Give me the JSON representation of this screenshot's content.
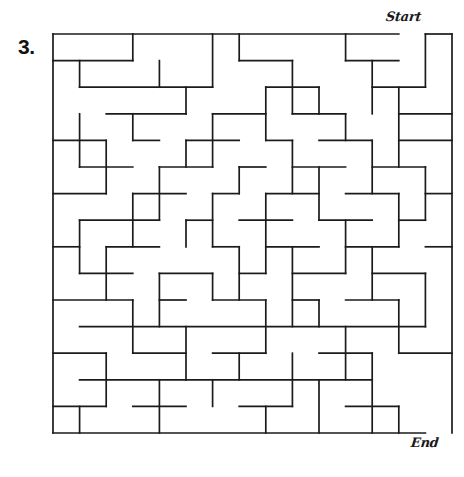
{
  "page": {
    "background_color": "#ffffff",
    "width": 464,
    "height": 477
  },
  "puzzle": {
    "number_label": "3.",
    "start_label": "Start",
    "end_label": "End",
    "type": "maze",
    "wall_color": "#1b1b1b",
    "grid": {
      "cols": 15,
      "rows": 15,
      "origin_x": 53,
      "origin_y": 34,
      "cell": 26.6
    },
    "entrance": {
      "side": "top",
      "col": 14,
      "description": "gap in top wall at rightmost column"
    },
    "exit": {
      "side": "bottom",
      "col": 14,
      "description": "gap in bottom wall at rightmost column"
    },
    "walls": {
      "h": [
        [
          0,
          0,
          13
        ],
        [
          14,
          0,
          15
        ],
        [
          0,
          1,
          3
        ],
        [
          7,
          1,
          9
        ],
        [
          11,
          1,
          13
        ],
        [
          1,
          2,
          6
        ],
        [
          8,
          2,
          10
        ],
        [
          12,
          2,
          14
        ],
        [
          2,
          3,
          5
        ],
        [
          6,
          3,
          8
        ],
        [
          9,
          3,
          11
        ],
        [
          13,
          3,
          15
        ],
        [
          0,
          4,
          2
        ],
        [
          3,
          4,
          4
        ],
        [
          5,
          4,
          7
        ],
        [
          8,
          4,
          9
        ],
        [
          10,
          4,
          12
        ],
        [
          13,
          4,
          15
        ],
        [
          1,
          5,
          3
        ],
        [
          4,
          5,
          6
        ],
        [
          7,
          5,
          8
        ],
        [
          9,
          5,
          11
        ],
        [
          12,
          5,
          14
        ],
        [
          0,
          6,
          2
        ],
        [
          3,
          6,
          5
        ],
        [
          6,
          6,
          7
        ],
        [
          8,
          6,
          10
        ],
        [
          11,
          6,
          13
        ],
        [
          14,
          6,
          15
        ],
        [
          1,
          7,
          4
        ],
        [
          5,
          7,
          6
        ],
        [
          7,
          7,
          9
        ],
        [
          10,
          7,
          12
        ],
        [
          13,
          7,
          14
        ],
        [
          0,
          8,
          1
        ],
        [
          2,
          8,
          4
        ],
        [
          6,
          8,
          7
        ],
        [
          8,
          8,
          10
        ],
        [
          11,
          8,
          13
        ],
        [
          14,
          8,
          15
        ],
        [
          1,
          9,
          3
        ],
        [
          4,
          9,
          6
        ],
        [
          7,
          9,
          8
        ],
        [
          9,
          9,
          11
        ],
        [
          12,
          9,
          14
        ],
        [
          0,
          10,
          3
        ],
        [
          4,
          10,
          5
        ],
        [
          6,
          10,
          8
        ],
        [
          9,
          10,
          10
        ],
        [
          11,
          10,
          13
        ],
        [
          1,
          11,
          14
        ],
        [
          0,
          12,
          2
        ],
        [
          3,
          12,
          5
        ],
        [
          6,
          12,
          8
        ],
        [
          10,
          12,
          12
        ],
        [
          13,
          12,
          15
        ],
        [
          1,
          13,
          12
        ],
        [
          0,
          14,
          2
        ],
        [
          3,
          14,
          5
        ],
        [
          7,
          14,
          9
        ],
        [
          11,
          14,
          13
        ],
        [
          0,
          15,
          14
        ]
      ],
      "v": [
        [
          0,
          0,
          15
        ],
        [
          3,
          0,
          1
        ],
        [
          6,
          0,
          2
        ],
        [
          7,
          0,
          1
        ],
        [
          11,
          0,
          1
        ],
        [
          14,
          0,
          2
        ],
        [
          15,
          0,
          15
        ],
        [
          1,
          1,
          2
        ],
        [
          4,
          1,
          2
        ],
        [
          9,
          1,
          3
        ],
        [
          12,
          1,
          3
        ],
        [
          5,
          2,
          3
        ],
        [
          8,
          2,
          4
        ],
        [
          10,
          2,
          3
        ],
        [
          13,
          2,
          5
        ],
        [
          1,
          3,
          5
        ],
        [
          3,
          3,
          4
        ],
        [
          6,
          3,
          5
        ],
        [
          11,
          3,
          4
        ],
        [
          2,
          4,
          6
        ],
        [
          5,
          4,
          5
        ],
        [
          9,
          4,
          6
        ],
        [
          12,
          4,
          6
        ],
        [
          4,
          5,
          7
        ],
        [
          7,
          5,
          6
        ],
        [
          10,
          5,
          7
        ],
        [
          14,
          5,
          7
        ],
        [
          3,
          6,
          8
        ],
        [
          6,
          6,
          8
        ],
        [
          8,
          6,
          9
        ],
        [
          13,
          6,
          8
        ],
        [
          1,
          7,
          9
        ],
        [
          5,
          7,
          8
        ],
        [
          11,
          7,
          9
        ],
        [
          2,
          8,
          10
        ],
        [
          7,
          8,
          10
        ],
        [
          9,
          8,
          11
        ],
        [
          12,
          8,
          10
        ],
        [
          4,
          9,
          11
        ],
        [
          6,
          9,
          10
        ],
        [
          14,
          9,
          11
        ],
        [
          3,
          10,
          12
        ],
        [
          8,
          10,
          12
        ],
        [
          10,
          10,
          11
        ],
        [
          13,
          10,
          12
        ],
        [
          5,
          11,
          13
        ],
        [
          11,
          11,
          13
        ],
        [
          2,
          12,
          14
        ],
        [
          7,
          12,
          13
        ],
        [
          9,
          12,
          14
        ],
        [
          12,
          12,
          15
        ],
        [
          4,
          13,
          15
        ],
        [
          6,
          13,
          14
        ],
        [
          10,
          13,
          15
        ],
        [
          1,
          14,
          15
        ],
        [
          8,
          14,
          15
        ],
        [
          13,
          14,
          15
        ]
      ]
    }
  }
}
